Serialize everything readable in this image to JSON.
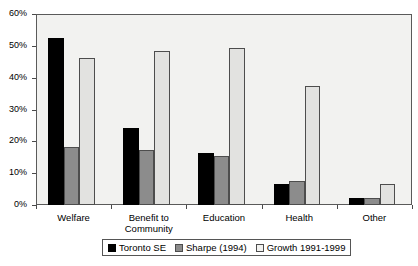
{
  "chart_data": {
    "type": "bar",
    "title": "",
    "subtitle": "",
    "xlabel": "",
    "ylabel": "",
    "ylim": [
      0,
      60
    ],
    "ytick_labels": [
      "0%",
      "10%",
      "20%",
      "30%",
      "40%",
      "50%",
      "60%"
    ],
    "ytick_values": [
      0,
      10,
      20,
      30,
      40,
      50,
      60
    ],
    "grid": false,
    "legend_position": "bottom-center",
    "categories": [
      "Welfare",
      "Benefit to\nCommunity",
      "Education",
      "Health",
      "Other"
    ],
    "series": [
      {
        "name": "Toronto SE",
        "color": "#000000",
        "values": [
          52.5,
          24.3,
          16.4,
          6.5,
          2.2
        ]
      },
      {
        "name": "Sharpe (1994)",
        "color": "#8c8c8c",
        "values": [
          18.2,
          17.3,
          15.3,
          7.4,
          2.3
        ]
      },
      {
        "name": "Growth 1991-1999",
        "color": "#f2f2f0",
        "values": [
          46.2,
          48.4,
          49.4,
          37.4,
          6.5
        ]
      }
    ]
  },
  "legend": {
    "items": [
      {
        "label": "Toronto SE"
      },
      {
        "label": "Sharpe (1994)"
      },
      {
        "label": "Growth 1991-1999"
      }
    ]
  }
}
